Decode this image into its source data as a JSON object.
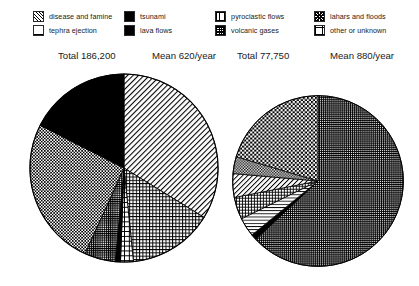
{
  "legend": {
    "columns": [
      {
        "items": [
          {
            "label": "disease and famine",
            "pattern": "diagonal-hatch",
            "key": "disease"
          },
          {
            "label": "tephra ejection",
            "pattern": "fine-grid",
            "key": "tephra"
          }
        ]
      },
      {
        "items": [
          {
            "label": "tsunami",
            "pattern": "solid-black",
            "key": "tsunami"
          },
          {
            "label": "lava flows",
            "pattern": "solid-black",
            "key": "lava"
          }
        ]
      },
      {
        "items": [
          {
            "label": "pyroclastic flows",
            "pattern": "grid",
            "key": "pyroclastic"
          },
          {
            "label": "volcanic gases",
            "pattern": "dense-grid",
            "key": "gases"
          }
        ]
      },
      {
        "items": [
          {
            "label": "lahars and floods",
            "pattern": "checker",
            "key": "lahars"
          },
          {
            "label": "other or unknown",
            "pattern": "big-grid",
            "key": "other"
          }
        ]
      }
    ]
  },
  "headings": {
    "left_total": "Total 186,200",
    "left_mean": "Mean 620/year",
    "right_total": "Total 77,750",
    "right_mean": "Mean 880/year"
  },
  "chart_data": [
    {
      "type": "pie",
      "title": "Total 186,200",
      "subtitle": "Mean 620/year",
      "total": 186200,
      "mean_per_year": 620,
      "units": "deaths",
      "start_angle_deg": 0,
      "direction": "clockwise",
      "legend_position": "top",
      "categories": [
        "disease and famine",
        "tsunami",
        "lava flows",
        "pyroclastic flows",
        "volcanic gases",
        "lahars and floods",
        "other or unknown"
      ],
      "slices": [
        {
          "label": "disease and famine",
          "pattern": "diagonal-hatch",
          "percent": 33.8,
          "value": 62900
        },
        {
          "label": "pyroclastic flows",
          "pattern": "grid",
          "percent": 14.6,
          "value": 27200
        },
        {
          "label": "other or unknown",
          "pattern": "big-grid",
          "percent": 2.2,
          "value": 4100
        },
        {
          "label": "lava flows",
          "pattern": "solid-black",
          "percent": 0.9,
          "value": 1700
        },
        {
          "label": "volcanic gases",
          "pattern": "dense-grid",
          "percent": 5.3,
          "value": 9900
        },
        {
          "label": "lahars and floods",
          "pattern": "checker",
          "percent": 25.7,
          "value": 47900
        },
        {
          "label": "tsunami",
          "pattern": "solid-black",
          "percent": 17.5,
          "value": 32500
        }
      ]
    },
    {
      "type": "pie",
      "title": "Total 77,750",
      "subtitle": "Mean 880/year",
      "total": 77750,
      "mean_per_year": 880,
      "units": "deaths",
      "start_angle_deg": 0,
      "direction": "clockwise",
      "legend_position": "top",
      "categories": [
        "disease and famine",
        "tsunami",
        "lava flows",
        "pyroclastic flows",
        "volcanic gases",
        "lahars and floods",
        "other or unknown"
      ],
      "slices": [
        {
          "label": "volcanic gases",
          "pattern": "dense-grid",
          "percent": 63.0,
          "value": 48980
        },
        {
          "label": "lava flows",
          "pattern": "solid-black",
          "percent": 1.1,
          "value": 850
        },
        {
          "label": "other or unknown",
          "pattern": "horizontal-lines",
          "percent": 3.6,
          "value": 2800
        },
        {
          "label": "pyroclastic flows",
          "pattern": "grid",
          "percent": 4.2,
          "value": 3250
        },
        {
          "label": "disease and famine",
          "pattern": "diagonal-hatch",
          "percent": 4.5,
          "value": 3500
        },
        {
          "label": "lahars and floods",
          "pattern": "checker",
          "percent": 3.2,
          "value": 2500
        },
        {
          "label": "tephra ejection",
          "pattern": "coarse-checker",
          "percent": 20.4,
          "value": 15870
        }
      ]
    }
  ]
}
